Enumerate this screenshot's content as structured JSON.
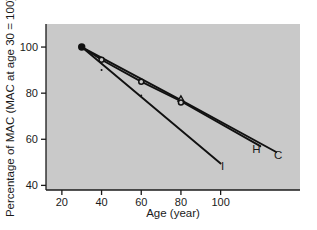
{
  "chart_data": {
    "type": "line",
    "title": "",
    "xlabel": "Age (year)",
    "ylabel": "Percentage of MAC (MAC at age 30 = 100)",
    "xlim": [
      12,
      140
    ],
    "ylim": [
      38,
      110
    ],
    "xticks": [
      20,
      40,
      60,
      80,
      100
    ],
    "yticks": [
      40,
      60,
      80,
      100
    ],
    "xtick_labels": [
      "20",
      "40",
      "60",
      "80",
      "100"
    ],
    "ytick_labels": [
      "40",
      "60",
      "80",
      "100"
    ],
    "grid": false,
    "legend": "inline-end-labels",
    "plot_background": "#c9c9c9",
    "line_color": "#111111",
    "series": [
      {
        "name": "C",
        "label": "C",
        "label_x": 129,
        "label_y": 53,
        "x": [
          30,
          80,
          128
        ],
        "values": [
          100,
          77,
          54.5
        ]
      },
      {
        "name": "H",
        "label": "H",
        "label_x": 118,
        "label_y": 56,
        "x": [
          30,
          40,
          60,
          80,
          120
        ],
        "values": [
          100,
          94.5,
          85,
          76.5,
          57
        ]
      },
      {
        "name": "I",
        "label": "I",
        "label_x": 101,
        "label_y": 48.5,
        "x": [
          30,
          100
        ],
        "values": [
          100,
          49.5
        ]
      }
    ],
    "markers": [
      {
        "shape": "filled-circle",
        "x": 30,
        "y": 100,
        "size": 6
      },
      {
        "shape": "open-circle",
        "x": 40,
        "y": 94.5,
        "size": 5
      },
      {
        "shape": "small-dot",
        "x": 40,
        "y": 90,
        "size": 2
      },
      {
        "shape": "open-circle",
        "x": 60,
        "y": 85,
        "size": 5
      },
      {
        "shape": "small-dot",
        "x": 60,
        "y": 79,
        "size": 2
      },
      {
        "shape": "triangle",
        "x": 80,
        "y": 77.5,
        "size": 5
      },
      {
        "shape": "open-circle",
        "x": 80,
        "y": 76,
        "size": 5
      }
    ]
  }
}
